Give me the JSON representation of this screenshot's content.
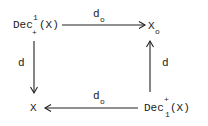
{
  "diagram": {
    "type": "commutative-square",
    "nodes": {
      "top_left": {
        "base": "Dec",
        "sup": "1",
        "sub": "+",
        "arg": "(X)"
      },
      "top_right": {
        "base": "X",
        "sub": "o"
      },
      "bottom_left": {
        "base": "X"
      },
      "bottom_right": {
        "base": "Dec",
        "sup": "+",
        "sub": "1",
        "arg": "(X)"
      }
    },
    "edges": {
      "top": {
        "label": "d",
        "label_sub": "o",
        "from": "top_left",
        "to": "top_right"
      },
      "left": {
        "label": "d",
        "from": "top_left",
        "to": "bottom_left"
      },
      "right": {
        "label": "d",
        "from": "bottom_right",
        "to": "top_right"
      },
      "bottom": {
        "label": "d",
        "label_sub": "o",
        "from": "bottom_right",
        "to": "bottom_left"
      }
    }
  }
}
